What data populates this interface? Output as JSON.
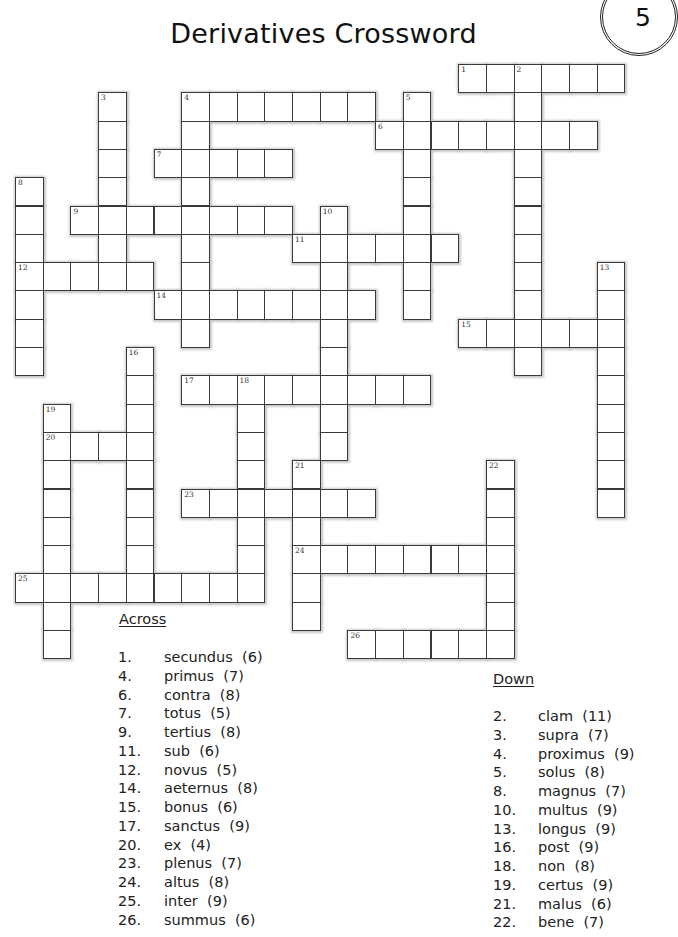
{
  "page": {
    "title": "Derivatives Crossword",
    "page_number": "5"
  },
  "grid": {
    "origin_x": 15,
    "origin_y": 64,
    "cell_w": 27.7,
    "cell_h": 28.3,
    "words": [
      {
        "num": "1",
        "dir": "across",
        "row": 0,
        "col": 16,
        "len": 6
      },
      {
        "num": "2",
        "dir": "down",
        "row": 0,
        "col": 18,
        "len": 11
      },
      {
        "num": "3",
        "dir": "down",
        "row": 1,
        "col": 3,
        "len": 7
      },
      {
        "num": "4",
        "dir": "across",
        "row": 1,
        "col": 6,
        "len": 7
      },
      {
        "num": "4",
        "dir": "down",
        "row": 1,
        "col": 6,
        "len": 9
      },
      {
        "num": "5",
        "dir": "down",
        "row": 1,
        "col": 14,
        "len": 8
      },
      {
        "num": "6",
        "dir": "across",
        "row": 2,
        "col": 13,
        "len": 8
      },
      {
        "num": "7",
        "dir": "across",
        "row": 3,
        "col": 5,
        "len": 5
      },
      {
        "num": "8",
        "dir": "down",
        "row": 4,
        "col": 0,
        "len": 7
      },
      {
        "num": "9",
        "dir": "across",
        "row": 5,
        "col": 2,
        "len": 8
      },
      {
        "num": "10",
        "dir": "down",
        "row": 5,
        "col": 11,
        "len": 9
      },
      {
        "num": "11",
        "dir": "across",
        "row": 6,
        "col": 10,
        "len": 6
      },
      {
        "num": "12",
        "dir": "across",
        "row": 7,
        "col": 0,
        "len": 5
      },
      {
        "num": "13",
        "dir": "down",
        "row": 7,
        "col": 21,
        "len": 9
      },
      {
        "num": "14",
        "dir": "across",
        "row": 8,
        "col": 5,
        "len": 8
      },
      {
        "num": "15",
        "dir": "across",
        "row": 9,
        "col": 16,
        "len": 6
      },
      {
        "num": "16",
        "dir": "down",
        "row": 10,
        "col": 4,
        "len": 9
      },
      {
        "num": "17",
        "dir": "across",
        "row": 11,
        "col": 6,
        "len": 9
      },
      {
        "num": "18",
        "dir": "down",
        "row": 11,
        "col": 8,
        "len": 8
      },
      {
        "num": "19",
        "dir": "down",
        "row": 12,
        "col": 1,
        "len": 9
      },
      {
        "num": "20",
        "dir": "across",
        "row": 13,
        "col": 1,
        "len": 4
      },
      {
        "num": "21",
        "dir": "down",
        "row": 14,
        "col": 10,
        "len": 6
      },
      {
        "num": "22",
        "dir": "down",
        "row": 14,
        "col": 17,
        "len": 7
      },
      {
        "num": "23",
        "dir": "across",
        "row": 15,
        "col": 6,
        "len": 7
      },
      {
        "num": "24",
        "dir": "across",
        "row": 17,
        "col": 10,
        "len": 8
      },
      {
        "num": "25",
        "dir": "across",
        "row": 18,
        "col": 0,
        "len": 9
      },
      {
        "num": "26",
        "dir": "across",
        "row": 20,
        "col": 12,
        "len": 6
      }
    ]
  },
  "clues": {
    "across": {
      "heading": "Across",
      "items": [
        {
          "num": "1.",
          "text": "secundus  (6)"
        },
        {
          "num": "4.",
          "text": "primus  (7)"
        },
        {
          "num": "6.",
          "text": "contra  (8)"
        },
        {
          "num": "7.",
          "text": "totus  (5)"
        },
        {
          "num": "9.",
          "text": "tertius  (8)"
        },
        {
          "num": "11.",
          "text": "sub  (6)"
        },
        {
          "num": "12.",
          "text": "novus  (5)"
        },
        {
          "num": "14.",
          "text": "aeternus  (8)"
        },
        {
          "num": "15.",
          "text": "bonus  (6)"
        },
        {
          "num": "17.",
          "text": "sanctus  (9)"
        },
        {
          "num": "20.",
          "text": "ex  (4)"
        },
        {
          "num": "23.",
          "text": "plenus  (7)"
        },
        {
          "num": "24.",
          "text": "altus  (8)"
        },
        {
          "num": "25.",
          "text": "inter  (9)"
        },
        {
          "num": "26.",
          "text": "summus  (6)"
        }
      ]
    },
    "down": {
      "heading": "Down",
      "items": [
        {
          "num": "2.",
          "text": "clam  (11)"
        },
        {
          "num": "3.",
          "text": "supra  (7)"
        },
        {
          "num": "4.",
          "text": "proximus  (9)"
        },
        {
          "num": "5.",
          "text": "solus  (8)"
        },
        {
          "num": "8.",
          "text": "magnus  (7)"
        },
        {
          "num": "10.",
          "text": "multus  (9)"
        },
        {
          "num": "13.",
          "text": "longus  (9)"
        },
        {
          "num": "16.",
          "text": "post  (9)"
        },
        {
          "num": "18.",
          "text": "non  (8)"
        },
        {
          "num": "19.",
          "text": "certus  (9)"
        },
        {
          "num": "21.",
          "text": "malus  (6)"
        },
        {
          "num": "22.",
          "text": "bene  (7)"
        }
      ]
    }
  }
}
